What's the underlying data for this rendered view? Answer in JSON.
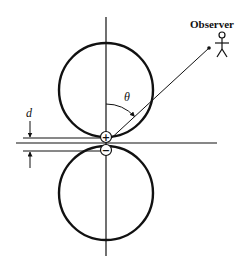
{
  "diagram": {
    "type": "dipole radiation pattern",
    "labels": {
      "observer": "Observer",
      "angle": "θ",
      "separation": "d",
      "positive_charge": "+",
      "negative_charge": "−"
    },
    "elements": [
      "vertical axis",
      "horizontal axis",
      "upper lobe (circle)",
      "lower lobe (circle)",
      "positive charge at origin (above)",
      "negative charge at origin (below)",
      "line of sight to observer",
      "angle θ arc with arrow from vertical to line of sight",
      "separation d dimension arrows",
      "stick-figure observer"
    ],
    "colors": {
      "ink": "#111111",
      "background": "#ffffff"
    }
  }
}
